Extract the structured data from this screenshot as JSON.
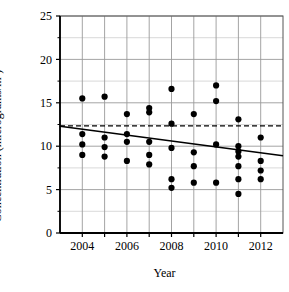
{
  "chart_data": {
    "type": "scatter",
    "title": "",
    "xlabel": "Year",
    "ylabel": "Concentration (micrograms/m³)",
    "xlim": [
      2003,
      2013
    ],
    "ylim": [
      0,
      25
    ],
    "yticks": [
      0,
      5,
      10,
      15,
      20,
      25
    ],
    "ytick_labels": [
      "0",
      "5",
      "10",
      "15",
      "20",
      "25"
    ],
    "xticks": [
      2004,
      2005,
      2006,
      2007,
      2008,
      2009,
      2010,
      2011,
      2012
    ],
    "xtick_labels": [
      "2004",
      "",
      "2006",
      "",
      "2008",
      "",
      "2010",
      "",
      "2012"
    ],
    "xtick_labels_shown": [
      "2004",
      "2006",
      "2008",
      "2010",
      "2012"
    ],
    "grid": true,
    "legend": false,
    "point_color": "#000000",
    "line_color": "#000000",
    "grid_color": "#9a9a9a",
    "points": [
      {
        "x": 2004,
        "y": 15.5
      },
      {
        "x": 2004,
        "y": 11.4
      },
      {
        "x": 2004,
        "y": 10.2
      },
      {
        "x": 2004,
        "y": 9.0
      },
      {
        "x": 2005,
        "y": 15.7
      },
      {
        "x": 2005,
        "y": 11.0
      },
      {
        "x": 2005,
        "y": 9.9
      },
      {
        "x": 2005,
        "y": 8.8
      },
      {
        "x": 2006,
        "y": 13.7
      },
      {
        "x": 2006,
        "y": 11.4
      },
      {
        "x": 2006,
        "y": 10.5
      },
      {
        "x": 2006,
        "y": 8.3
      },
      {
        "x": 2007,
        "y": 14.4
      },
      {
        "x": 2007,
        "y": 13.9
      },
      {
        "x": 2007,
        "y": 10.5
      },
      {
        "x": 2007,
        "y": 9.0
      },
      {
        "x": 2007,
        "y": 7.9
      },
      {
        "x": 2008,
        "y": 16.6
      },
      {
        "x": 2008,
        "y": 12.6
      },
      {
        "x": 2008,
        "y": 9.8
      },
      {
        "x": 2008,
        "y": 6.2
      },
      {
        "x": 2008,
        "y": 5.2
      },
      {
        "x": 2009,
        "y": 13.7
      },
      {
        "x": 2009,
        "y": 9.3
      },
      {
        "x": 2009,
        "y": 7.7
      },
      {
        "x": 2009,
        "y": 5.8
      },
      {
        "x": 2010,
        "y": 17.0
      },
      {
        "x": 2010,
        "y": 15.2
      },
      {
        "x": 2010,
        "y": 10.2
      },
      {
        "x": 2010,
        "y": 5.8
      },
      {
        "x": 2011,
        "y": 13.1
      },
      {
        "x": 2011,
        "y": 10.0
      },
      {
        "x": 2011,
        "y": 9.4
      },
      {
        "x": 2011,
        "y": 8.8
      },
      {
        "x": 2011,
        "y": 7.7
      },
      {
        "x": 2011,
        "y": 6.2
      },
      {
        "x": 2011,
        "y": 4.5
      },
      {
        "x": 2012,
        "y": 11.0
      },
      {
        "x": 2012,
        "y": 8.3
      },
      {
        "x": 2012,
        "y": 7.2
      },
      {
        "x": 2012,
        "y": 6.2
      }
    ],
    "trend_line": {
      "style": "solid",
      "x_start": 2003,
      "y_start": 12.3,
      "x_end": 2013,
      "y_end": 8.9,
      "label": "trend-line"
    },
    "reference_line": {
      "style": "dashed",
      "y": 12.35,
      "label": "mean-reference-line"
    }
  }
}
